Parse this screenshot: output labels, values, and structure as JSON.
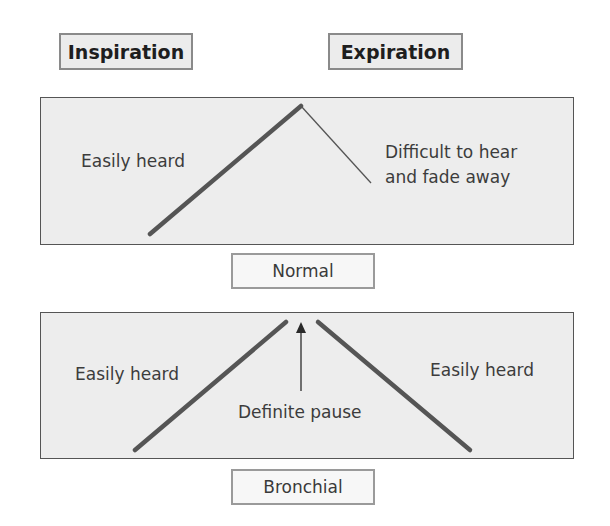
{
  "headers": {
    "inspiration": "Inspiration",
    "expiration": "Expiration"
  },
  "normal": {
    "left_text": "Easily heard",
    "right_text_line1": "Difficult to hear",
    "right_text_line2": "and fade away",
    "caption": "Normal"
  },
  "bronchial": {
    "left_text": "Easily heard",
    "right_text": "Easily heard",
    "pause_text": "Definite pause",
    "caption": "Bronchial"
  },
  "colors": {
    "panel_bg": "#ededed",
    "line": "#555555",
    "header_bg": "#ececec"
  }
}
